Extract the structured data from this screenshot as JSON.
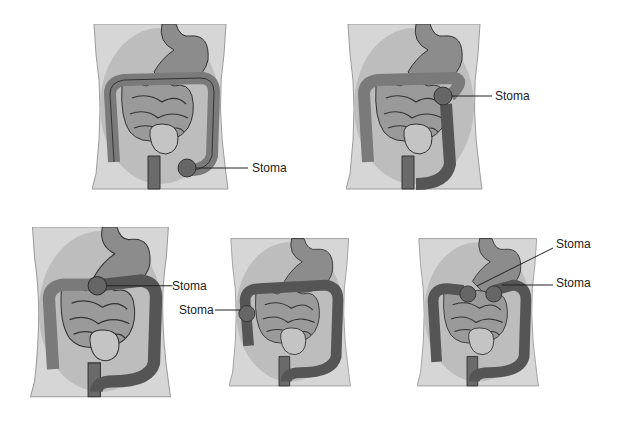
{
  "figure": {
    "colors": {
      "skin": "#d6d6d6",
      "cavity": "#bdbdbd",
      "stomach": "#8c8c8c",
      "small_bowel": "#9a9a9a",
      "colon_active": "#7a7a7a",
      "colon_defunct": "#555555",
      "outline": "#333333",
      "bladder": "#c4c4c4"
    },
    "panels": [
      {
        "id": "panel-1",
        "stomas": [
          {
            "label": "Stoma"
          }
        ]
      },
      {
        "id": "panel-2",
        "stomas": [
          {
            "label": "Stoma"
          }
        ]
      },
      {
        "id": "panel-3",
        "stomas": [
          {
            "label": "Stoma"
          }
        ]
      },
      {
        "id": "panel-4",
        "stomas": [
          {
            "label": "Stoma"
          }
        ]
      },
      {
        "id": "panel-5",
        "stomas": [
          {
            "label": "Stoma"
          },
          {
            "label": "Stoma"
          }
        ]
      }
    ]
  }
}
